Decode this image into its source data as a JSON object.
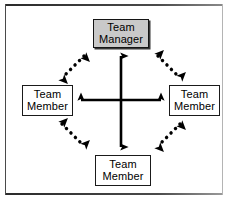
{
  "figure": {
    "width": 227,
    "height": 202,
    "background_color": "#ffffff",
    "frame_color": "#3a3a3a"
  },
  "nodes": {
    "manager": {
      "id": "team-manager",
      "line1": "Team",
      "line2": "Manager",
      "fill_color": "#c9c9c9",
      "border_color": "#141414",
      "role": "manager",
      "position": "top"
    },
    "member_left": {
      "id": "team-member-left",
      "line1": "Team",
      "line2": "Member",
      "fill_color": "#ffffff",
      "border_color": "#1a1a1a",
      "role": "member",
      "position": "left"
    },
    "member_right": {
      "id": "team-member-right",
      "line1": "Team",
      "line2": "Member",
      "fill_color": "#ffffff",
      "border_color": "#1a1a1a",
      "role": "member",
      "position": "right"
    },
    "member_bottom": {
      "id": "team-member-bottom",
      "line1": "Team",
      "line2": "Member",
      "fill_color": "#ffffff",
      "border_color": "#1a1a1a",
      "role": "member",
      "position": "bottom"
    }
  },
  "connectors": [
    {
      "id": "vertical-axis",
      "from": "team-manager",
      "to": "team-member-bottom",
      "style": "solid",
      "arrowheads": "both",
      "color": "#000000"
    },
    {
      "id": "horizontal-axis",
      "from": "team-member-left",
      "to": "team-member-right",
      "style": "solid",
      "arrowheads": "both",
      "color": "#000000"
    },
    {
      "id": "diagonal-manager-left",
      "from": "team-manager",
      "to": "team-member-left",
      "style": "dotted",
      "arrowheads": "both",
      "color": "#000000"
    },
    {
      "id": "diagonal-manager-right",
      "from": "team-manager",
      "to": "team-member-right",
      "style": "dotted",
      "arrowheads": "both",
      "color": "#000000"
    },
    {
      "id": "diagonal-left-bottom",
      "from": "team-member-left",
      "to": "team-member-bottom",
      "style": "dotted",
      "arrowheads": "both",
      "color": "#000000"
    },
    {
      "id": "diagonal-right-bottom",
      "from": "team-member-right",
      "to": "team-member-bottom",
      "style": "dotted",
      "arrowheads": "both",
      "color": "#000000"
    }
  ]
}
